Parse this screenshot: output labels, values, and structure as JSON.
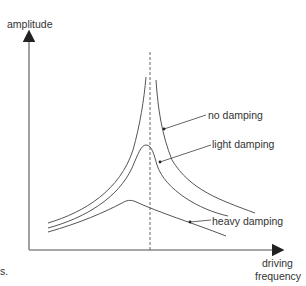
{
  "diagram": {
    "type": "resonance-curves",
    "y_axis_label": "amplitude",
    "x_axis_label_line1": "driving",
    "x_axis_label_line2": "frequency",
    "resonance_marker": "dashed vertical line at natural frequency",
    "curves": [
      {
        "name": "no damping",
        "label": "no damping"
      },
      {
        "name": "light damping",
        "label": "light damping"
      },
      {
        "name": "heavy damping",
        "label": "heavy damping"
      }
    ],
    "fragment_text": "s."
  },
  "colors": {
    "axis": "#8a8a8a",
    "curve": "#555555",
    "text": "#333333"
  }
}
